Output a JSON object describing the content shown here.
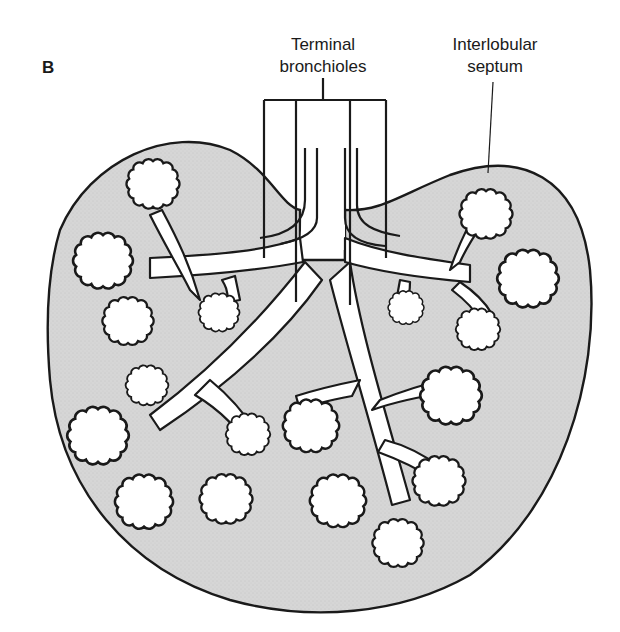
{
  "figure": {
    "panel_letter": "B"
  },
  "labels": {
    "terminal_bronchioles": {
      "line1": "Terminal",
      "line2": "bronchioles"
    },
    "interlobular_septum": {
      "line1": "Interlobular",
      "line2": "septum"
    }
  },
  "colors": {
    "lobule_fill": "#d4d4d4",
    "outline": "#1a1a1a",
    "airway_fill": "#ffffff",
    "background": "#ffffff"
  }
}
